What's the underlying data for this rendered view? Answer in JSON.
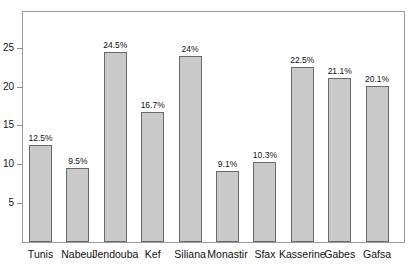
{
  "caption": {
    "clipped_text": ""
  },
  "chart_data": {
    "type": "bar",
    "title": "",
    "subtitle": "",
    "xlabel": "",
    "ylabel": "",
    "categories": [
      "Tunis",
      "Nabeul",
      "Jendouba",
      "Kef",
      "Siliana",
      "Monastir",
      "Sfax",
      "Kasserine",
      "Gabes",
      "Gafsa"
    ],
    "values": [
      12.5,
      9.5,
      24.5,
      16.7,
      24.0,
      9.1,
      10.3,
      22.5,
      21.1,
      20.1
    ],
    "value_labels": [
      "12.5%",
      "9.5%",
      "24.5%",
      "16.7%",
      "24%",
      "9.1%",
      "10.3%",
      "22.5%",
      "21.1%",
      "20.1%"
    ],
    "ylim": [
      0,
      29.6
    ],
    "yticks": [
      5,
      10,
      15,
      20,
      25
    ],
    "ytick_labels": [
      "5",
      "10",
      "15",
      "20",
      "25"
    ],
    "grid": false,
    "legend": null,
    "series": [
      {
        "name": "",
        "values": [
          12.5,
          9.5,
          24.5,
          16.7,
          24.0,
          9.1,
          10.3,
          22.5,
          21.1,
          20.1
        ]
      }
    ],
    "colors": {
      "bar_fill": "#c9c9c9",
      "bar_stroke": "#6a6a6a",
      "frame": "#9a9a9a",
      "text": "#111111"
    }
  }
}
